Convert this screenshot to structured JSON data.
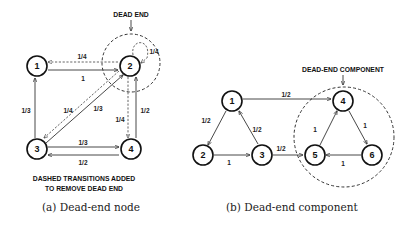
{
  "panel_a": {
    "caption": "(a) Dead-end node",
    "annotation_top": "DEAD END",
    "annotation_bottom_line1": "DASHED TRANSITIONS ADDED",
    "annotation_bottom_line2": "TO REMOVE DEAD END",
    "nodes": [
      {
        "id": "1",
        "label": "1"
      },
      {
        "id": "2",
        "label": "2"
      },
      {
        "id": "3",
        "label": "3"
      },
      {
        "id": "4",
        "label": "4"
      }
    ],
    "edges": [
      {
        "from": "1",
        "to": "2",
        "weight": "1",
        "style": "solid"
      },
      {
        "from": "3",
        "to": "1",
        "weight": "1/3",
        "style": "solid"
      },
      {
        "from": "3",
        "to": "2",
        "weight": "1/3",
        "style": "solid"
      },
      {
        "from": "3",
        "to": "4",
        "weight": "1/3",
        "style": "solid"
      },
      {
        "from": "4",
        "to": "3",
        "weight": "1/2",
        "style": "solid"
      },
      {
        "from": "4",
        "to": "2",
        "weight": "1/2",
        "style": "solid"
      },
      {
        "from": "2",
        "to": "1",
        "weight": "1/4",
        "style": "dashed"
      },
      {
        "from": "2",
        "to": "2",
        "weight": "1/4",
        "style": "dashed"
      },
      {
        "from": "2",
        "to": "3",
        "weight": "1/4",
        "style": "dashed"
      },
      {
        "from": "2",
        "to": "4",
        "weight": "1/4",
        "style": "dashed"
      }
    ]
  },
  "panel_b": {
    "caption": "(b) Dead-end component",
    "annotation_top": "DEAD-END COMPONENT",
    "nodes": [
      {
        "id": "1",
        "label": "1"
      },
      {
        "id": "2",
        "label": "2"
      },
      {
        "id": "3",
        "label": "3"
      },
      {
        "id": "4",
        "label": "4"
      },
      {
        "id": "5",
        "label": "5"
      },
      {
        "id": "6",
        "label": "6"
      }
    ],
    "edges": [
      {
        "from": "1",
        "to": "4",
        "weight": "1/2",
        "style": "solid"
      },
      {
        "from": "1",
        "to": "2",
        "weight": "1/2",
        "style": "solid"
      },
      {
        "from": "2",
        "to": "3",
        "weight": "1",
        "style": "solid"
      },
      {
        "from": "3",
        "to": "1",
        "weight": "1/2",
        "style": "solid"
      },
      {
        "from": "3",
        "to": "5",
        "weight": "1/2",
        "style": "solid"
      },
      {
        "from": "5",
        "to": "4",
        "weight": "1",
        "style": "solid"
      },
      {
        "from": "4",
        "to": "6",
        "weight": "1",
        "style": "solid"
      },
      {
        "from": "6",
        "to": "5",
        "weight": "1",
        "style": "solid"
      }
    ]
  }
}
